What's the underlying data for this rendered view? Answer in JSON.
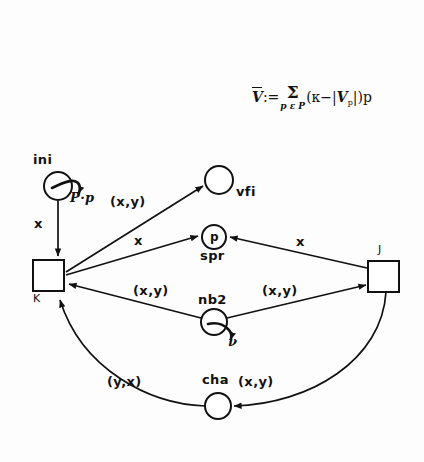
{
  "figure": {
    "kind": "petri-net-diagram",
    "background_color": "#fdfdfd",
    "ink_color": "#111111"
  },
  "formula": {
    "lhs": "V",
    "assign": ":=",
    "sum_symbol": "Σ",
    "sum_subscript": "p ε P",
    "body_open": "(",
    "kappa": "κ",
    "minus": "−",
    "bar_open": "|",
    "v_sub": "V",
    "v_sub_index": "p",
    "bar_close": "|",
    "body_close": ")",
    "tail": "p",
    "plain_text": "V̄ := Σ_{pεP} (κ − |V_p|) p"
  },
  "places": [
    {
      "id": "ini",
      "label": "ini",
      "label_position": "above",
      "cx": 58,
      "cy": 186,
      "r": 14,
      "token_label": "",
      "marking_label": "P·p",
      "has_marking_arrow": true
    },
    {
      "id": "vfi",
      "label": "vfi",
      "label_position": "right",
      "cx": 219,
      "cy": 180,
      "r": 14,
      "token_label": "",
      "marking_label": "",
      "has_marking_arrow": false
    },
    {
      "id": "spr",
      "label": "spr",
      "label_position": "below",
      "cx": 214,
      "cy": 237,
      "r": 12,
      "token_label": "p",
      "marking_label": "",
      "has_marking_arrow": false
    },
    {
      "id": "nb2",
      "label": "nb2",
      "label_position": "above",
      "cx": 214,
      "cy": 322,
      "r": 13,
      "token_label": "",
      "marking_label": "ν",
      "has_marking_arrow": true
    },
    {
      "id": "cha",
      "label": "cha",
      "label_position": "above",
      "cx": 218,
      "cy": 406,
      "r": 13,
      "token_label": "",
      "marking_label": "",
      "has_marking_arrow": false
    }
  ],
  "transitions": [
    {
      "id": "K",
      "label": "K",
      "label_position": "below-left",
      "x": 33,
      "y": 260,
      "w": 31,
      "h": 31
    },
    {
      "id": "J",
      "label": "J",
      "label_position": "above",
      "x": 368,
      "y": 261,
      "w": 31,
      "h": 31
    }
  ],
  "arcs": [
    {
      "id": "ini-to-K",
      "from": "ini",
      "to": "K",
      "label": "x",
      "label_x": 34,
      "label_y": 216
    },
    {
      "id": "K-to-vfi",
      "from": "K",
      "to": "vfi",
      "label": "(x,y)",
      "label_x": 110,
      "label_y": 194
    },
    {
      "id": "K-to-spr",
      "from": "K",
      "to": "spr",
      "label": "x",
      "label_x": 134,
      "label_y": 233
    },
    {
      "id": "J-to-spr",
      "from": "J",
      "to": "spr",
      "label": "x",
      "label_x": 296,
      "label_y": 234
    },
    {
      "id": "nb2-to-K",
      "from": "nb2",
      "to": "K",
      "label": "(x,y)",
      "label_x": 133,
      "label_y": 283
    },
    {
      "id": "nb2-to-J",
      "from": "nb2",
      "to": "J",
      "label": "(x,y)",
      "label_x": 262,
      "label_y": 283
    },
    {
      "id": "cha-to-K",
      "from": "cha",
      "to": "K",
      "label": "(y,x)",
      "label_x": 107,
      "label_y": 374
    },
    {
      "id": "J-to-cha",
      "from": "J",
      "to": "cha",
      "label": "(x,y)",
      "label_x": 238,
      "label_y": 374
    }
  ]
}
